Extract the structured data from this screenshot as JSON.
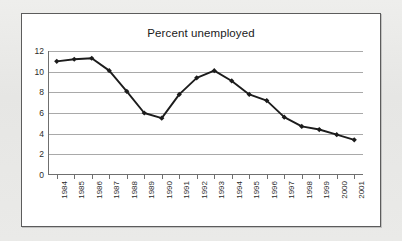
{
  "chart": {
    "title": "Percent unemployed"
  },
  "chart_data": {
    "type": "line",
    "title": "Percent unemployed",
    "xlabel": "",
    "ylabel": "",
    "categories": [
      "1984",
      "1985",
      "1986",
      "1987",
      "1988",
      "1989",
      "1990",
      "1991",
      "1992",
      "1993",
      "1994",
      "1995",
      "1996",
      "1997",
      "1998",
      "1999",
      "2000",
      "2001"
    ],
    "values": [
      11.0,
      11.2,
      11.3,
      10.1,
      8.1,
      6.0,
      5.5,
      7.8,
      9.4,
      10.1,
      9.1,
      7.8,
      7.2,
      5.6,
      4.7,
      4.4,
      3.9,
      3.4
    ],
    "series": [
      {
        "name": "Percent unemployed",
        "values": [
          11.0,
          11.2,
          11.3,
          10.1,
          8.1,
          6.0,
          5.5,
          7.8,
          9.4,
          10.1,
          9.1,
          7.8,
          7.2,
          5.6,
          4.7,
          4.4,
          3.9,
          3.4
        ]
      }
    ],
    "ylim": [
      0,
      12
    ],
    "yticks": [
      0,
      2,
      4,
      6,
      8,
      10,
      12
    ],
    "ytick_labels": [
      "0",
      "2",
      "4",
      "6",
      "8",
      "10",
      "12"
    ],
    "grid": true,
    "legend": false,
    "marker": "diamond",
    "line_color": "#1c1c1c",
    "marker_color": "#1c1c1c",
    "gridline_color": "#a9a9a9",
    "axis_color": "#6f6f6f",
    "plot_background": "#ffffff",
    "frame_border_color": "#5c5c5c",
    "page_background": "#e8e8e6"
  }
}
